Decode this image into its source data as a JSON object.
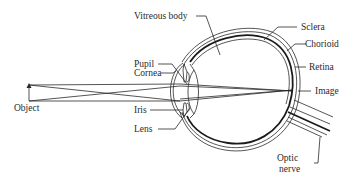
{
  "diagram": {
    "colors": {
      "ink": "#2a2a2a",
      "background": "#ffffff"
    },
    "labels": {
      "vitreous_body": "Vitreous body",
      "sclera": "Sclera",
      "chorioid": "Chorioid",
      "retina": "Retina",
      "pupil": "Pupil",
      "cornea": "Cornea",
      "image": "Image",
      "object": "Object",
      "iris": "Iris",
      "lens": "Lens",
      "optic": "Optic",
      "nerve": "nerve"
    }
  }
}
